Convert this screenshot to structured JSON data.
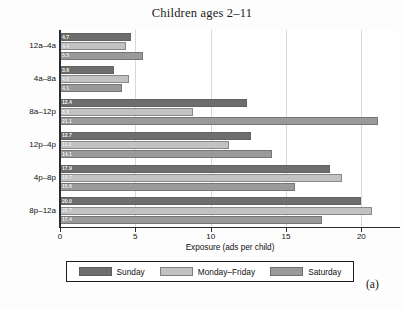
{
  "figure": {
    "panel_tag": "(a)"
  },
  "chart_data": {
    "type": "bar",
    "orientation": "horizontal",
    "title": "Children ages 2–11",
    "xlabel": "Exposure (ads per child)",
    "ylabel": "",
    "xlim": [
      0,
      22.5
    ],
    "xticks": [
      0,
      5,
      10,
      15,
      20
    ],
    "xtick_labels": [
      "0",
      "5",
      "10",
      "15",
      "20"
    ],
    "grid": true,
    "grid_axis": "x",
    "legend_position": "below",
    "categories": [
      "12a–4a",
      "4a–8a",
      "8a–12p",
      "12p–4p",
      "4p–8p",
      "8p–12a"
    ],
    "series": [
      {
        "name": "Sunday",
        "color": "#6e6e6e",
        "values": [
          4.7,
          3.6,
          12.4,
          12.7,
          17.9,
          20.0
        ],
        "labels": [
          "4.7",
          "3.6",
          "12.4",
          "12.7",
          "17.9",
          "20.0"
        ]
      },
      {
        "name": "Monday–Friday",
        "color": "#c2c2c2",
        "values": [
          4.4,
          4.6,
          8.8,
          11.2,
          18.7,
          20.7
        ],
        "labels": [
          "4.4",
          "4.6",
          "8.8",
          "11.2",
          "18.7",
          "20.7"
        ]
      },
      {
        "name": "Saturday",
        "color": "#9a9a9a",
        "values": [
          5.5,
          4.1,
          21.1,
          14.1,
          15.6,
          17.4
        ],
        "labels": [
          "5.5",
          "4.1",
          "21.1",
          "14.1",
          "15.6",
          "17.4"
        ]
      }
    ]
  }
}
